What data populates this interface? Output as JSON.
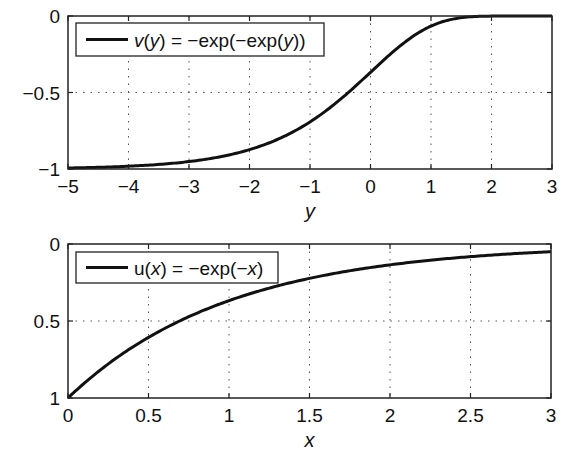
{
  "chart_data": [
    {
      "type": "line",
      "title": "",
      "xlabel": "y",
      "ylabel": "",
      "xlim": [
        -5,
        3
      ],
      "ylim": [
        -1,
        0
      ],
      "x_ticks": [
        -5,
        -4,
        -3,
        -2,
        -1,
        0,
        1,
        2,
        3
      ],
      "x_tick_labels": [
        "−5",
        "−4",
        "−3",
        "−2",
        "−1",
        "0",
        "1",
        "2",
        "3"
      ],
      "y_ticks": [
        0,
        -0.5,
        -1
      ],
      "y_tick_labels": [
        "0",
        "−0.5",
        "−1"
      ],
      "y_reversed": false,
      "grid": true,
      "grid_style": "dotted",
      "legend_position": "upper left",
      "series": [
        {
          "name": "v(y) = −exp(−exp(y))",
          "legend_parts": [
            {
              "t": "v",
              "i": true
            },
            {
              "t": "(",
              "i": false
            },
            {
              "t": "y",
              "i": true
            },
            {
              "t": ") = −exp(−exp(",
              "i": false
            },
            {
              "t": "y",
              "i": true
            },
            {
              "t": "))",
              "i": false
            }
          ],
          "function": "-exp(-exp(y))",
          "color": "#111111",
          "x": [
            -5,
            -4,
            -3,
            -2,
            -1.5,
            -1,
            -0.5,
            0,
            0.5,
            1,
            1.5,
            2,
            3
          ],
          "values": [
            -0.993,
            -0.982,
            -0.952,
            -0.873,
            -0.8,
            -0.692,
            -0.545,
            -0.368,
            -0.192,
            -0.066,
            -0.011,
            -0.001,
            0.0
          ]
        }
      ]
    },
    {
      "type": "line",
      "title": "",
      "xlabel": "x",
      "ylabel": "",
      "xlim": [
        0,
        3
      ],
      "ylim": [
        0,
        1
      ],
      "x_ticks": [
        0,
        0.5,
        1,
        1.5,
        2,
        2.5,
        3
      ],
      "x_tick_labels": [
        "0",
        "0.5",
        "1",
        "1.5",
        "2",
        "2.5",
        "3"
      ],
      "y_ticks": [
        0,
        0.5,
        1
      ],
      "y_tick_labels": [
        "0",
        "0.5",
        "1"
      ],
      "y_reversed": true,
      "grid": true,
      "grid_style": "dotted",
      "legend_position": "upper left",
      "series": [
        {
          "name": "u(x) = −exp(−x)",
          "legend_parts": [
            {
              "t": "u(",
              "i": false
            },
            {
              "t": "x",
              "i": true
            },
            {
              "t": ") = −exp(−",
              "i": false
            },
            {
              "t": "x",
              "i": true
            },
            {
              "t": ")",
              "i": false
            }
          ],
          "function": "exp(-x) (plotted on reversed axis)",
          "color": "#111111",
          "x": [
            0,
            0.25,
            0.5,
            0.75,
            1,
            1.5,
            2,
            2.5,
            3
          ],
          "values": [
            1.0,
            0.779,
            0.607,
            0.472,
            0.368,
            0.223,
            0.135,
            0.082,
            0.05
          ]
        }
      ]
    }
  ],
  "layout": {
    "plots": [
      {
        "left": 68,
        "top": 16,
        "right": 552,
        "bottom": 169,
        "legend": {
          "x": 76,
          "y": 23,
          "w": 248,
          "h": 33
        },
        "xlabel_y": 218
      },
      {
        "left": 68,
        "top": 244,
        "right": 551,
        "bottom": 398,
        "legend": {
          "x": 76,
          "y": 252,
          "w": 202,
          "h": 31
        },
        "xlabel_y": 447
      }
    ]
  }
}
